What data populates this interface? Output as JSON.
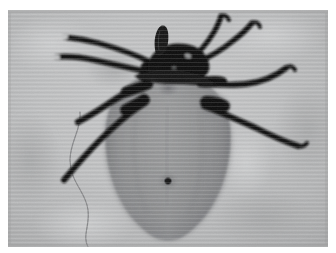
{
  "page": {
    "kind": "photograph",
    "background_color": "#ffffff",
    "canvas": {
      "width": 336,
      "height": 253
    }
  },
  "photo": {
    "name": "tick-dorsal-photograph",
    "frame": {
      "x": 8,
      "y": 10,
      "width": 320,
      "height": 237
    },
    "color_mode": "grayscale",
    "background": {
      "base_color": "#bcbdbe",
      "light_color": "#d2d3d4",
      "dark_color": "#a6a7a8",
      "texture": "mottled with faint horizontal scan lines"
    },
    "subject": {
      "label": "tick",
      "view": "dorsal",
      "idiosoma": {
        "label": "body (idiosoma)",
        "shape": "teardrop-oval",
        "center_x": 168,
        "top_y": 72,
        "bottom_y": 236,
        "half_width": 62,
        "fill_color": "#8e8f90",
        "edge_color": "#75767a",
        "highlight_color": "#9c9d9e"
      },
      "capitulum": {
        "label": "capitulum (mouthparts / head)",
        "color": "#121212",
        "center_x": 172,
        "center_y": 47
      },
      "hypostome": {
        "label": "hypostome projecting forward",
        "color": "#161616",
        "tip_x": 152,
        "tip_y": 19
      },
      "scutum_mark": {
        "label": "scutal depression",
        "x": 168,
        "y": 86,
        "color": "#7b7c7e"
      },
      "anal_pore": {
        "label": "dark pore on body midline",
        "x": 168,
        "y": 181,
        "radius": 4,
        "color": "#1a1a1a"
      },
      "legs": {
        "label": "eight dark legs",
        "count": 8,
        "color": "#0f0f0f",
        "tarsus_tip_color": "#cfd0d1",
        "left_count": 4,
        "right_count": 4
      },
      "filament": {
        "label": "thin wavy hair / mounting fibre",
        "color": "#8b8c8e",
        "from_x": 80,
        "from_y": 112,
        "to_x": 92,
        "to_y": 246
      }
    }
  }
}
